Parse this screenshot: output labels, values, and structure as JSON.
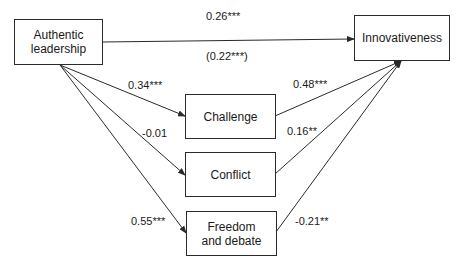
{
  "nodes": {
    "authentic_leadership": {
      "line1": "Authentic",
      "line2": "leadership"
    },
    "innovativeness": {
      "label": "Innovativeness"
    },
    "challenge": {
      "label": "Challenge"
    },
    "conflict": {
      "label": "Conflict"
    },
    "freedom_debate": {
      "line1": "Freedom",
      "line2": "and debate"
    }
  },
  "edges": {
    "al_to_innov_total": "0.26***",
    "al_to_innov_direct": "(0.22***)",
    "al_to_challenge": "0.34***",
    "al_to_conflict": "-0.01",
    "al_to_freedom": "0.55***",
    "challenge_to_innov": "0.48***",
    "conflict_to_innov": "0.16**",
    "freedom_to_innov": "-0.21**"
  },
  "colors": {
    "line": "#2a2a2a",
    "text": "#1a1a1a",
    "background": "#ffffff"
  }
}
